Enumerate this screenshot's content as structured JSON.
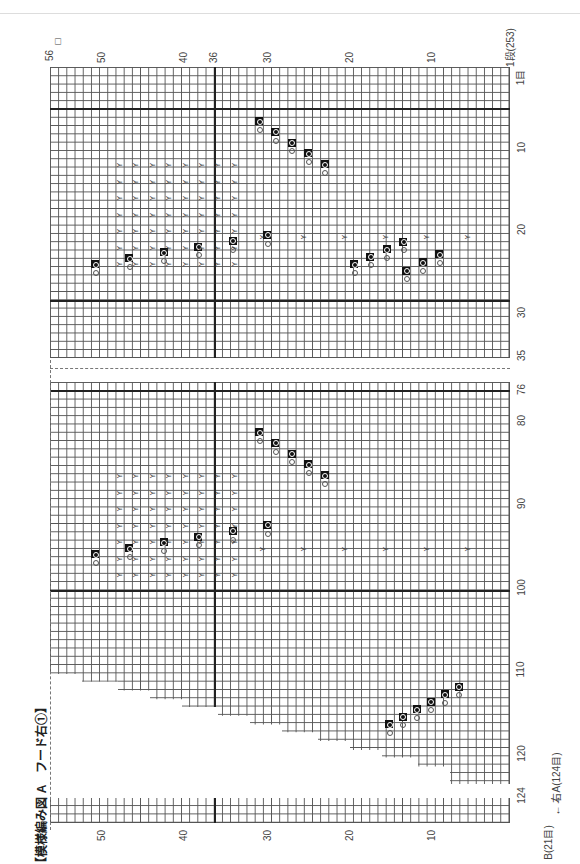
{
  "title": "【模様編み図 A　フード右①】",
  "row_axis": {
    "start_label": "1段(253)",
    "end_label": "56",
    "tick_labels": [
      "10",
      "20",
      "30",
      "40",
      "50"
    ],
    "corner_box": "□"
  },
  "stitch_axis_top": {
    "first_label": "1目",
    "tick_labels": [
      "10",
      "20",
      "30",
      "35"
    ],
    "marker_labels": [
      "36"
    ]
  },
  "stitch_axis_bottom": {
    "tick_labels": [
      "76",
      "80",
      "90",
      "100",
      "110",
      "120",
      "124"
    ]
  },
  "bottom_row_axis": {
    "tick_labels": [
      "10",
      "20",
      "30",
      "40",
      "50"
    ]
  },
  "footer_note": {
    "left_part": "B(21目)",
    "right_part": "右A(124目)",
    "arrow": "←→"
  },
  "legend_symbols": {
    "yarn_over": "○",
    "decrease": "⅄",
    "filled_stitch": "●"
  },
  "colors": {
    "grid_line": "#555555",
    "thick_line": "#222222",
    "filled_cell": "#111111",
    "background": "#ffffff"
  }
}
